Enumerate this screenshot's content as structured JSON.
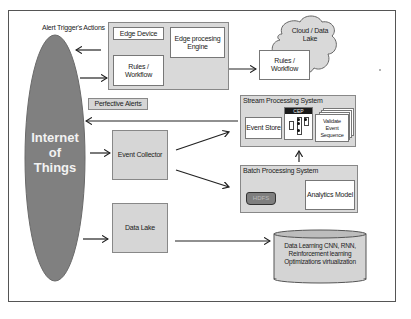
{
  "diagram": {
    "iot": {
      "label_line1": "Internet",
      "label_line2": "of",
      "label_line3": "Things",
      "color": "#808080"
    },
    "alert_trigger_label": "Alert Trigger's Actions",
    "edge": {
      "device_label": "Edge Device",
      "engine_label": "Edge procesing Engine",
      "rules_label": "Rules / Workflow"
    },
    "cloud": {
      "label": "Cloud / Data Lake",
      "rules_label": "Rules / Workflow"
    },
    "perfective_alerts_label": "Perfective Alerts",
    "stream": {
      "title": "Stream Processing System",
      "event_store_label": "Event Store",
      "cep_label": "CEP",
      "validate_label": "Validate Event Sequence"
    },
    "event_collector_label": "Event Collector",
    "batch": {
      "title": "Batch Processing System",
      "hdfs_label": "HDFS",
      "analytics_label": "Analytics Model"
    },
    "data_lake_label": "Data Lake",
    "learning": {
      "label": "Data Learning CNN, RNN, Reinforcement learning Optimizations virtualization"
    },
    "colors": {
      "group_fill": "#d9d9d9",
      "cloud_fill": "#d9d9d9",
      "box_fill": "#d6d6d6",
      "hdfs_fill": "#7f7f7f",
      "cep_header": "#1a1a1a"
    }
  }
}
